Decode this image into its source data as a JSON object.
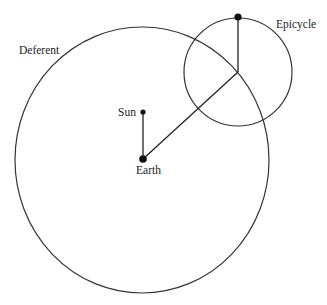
{
  "diagram": {
    "labels": {
      "deferent": "Deferent",
      "epicycle": "Epicycle",
      "sun": "Sun",
      "earth": "Earth"
    },
    "elements": [
      {
        "id": "deferent-circle",
        "kind": "circle",
        "label": "Deferent"
      },
      {
        "id": "epicycle-circle",
        "kind": "circle",
        "label": "Epicycle"
      },
      {
        "id": "sun-point",
        "kind": "point",
        "label": "Sun"
      },
      {
        "id": "earth-point",
        "kind": "point",
        "label": "Earth"
      },
      {
        "id": "planet-point",
        "kind": "point",
        "label": ""
      }
    ],
    "connections": [
      {
        "from": "earth-point",
        "to": "sun-point"
      },
      {
        "from": "earth-point",
        "to": "epicycle-center"
      },
      {
        "from": "epicycle-center",
        "to": "planet-point"
      }
    ],
    "colors": {
      "stroke": "#333333",
      "point": "#111111",
      "background": "#ffffff"
    }
  }
}
